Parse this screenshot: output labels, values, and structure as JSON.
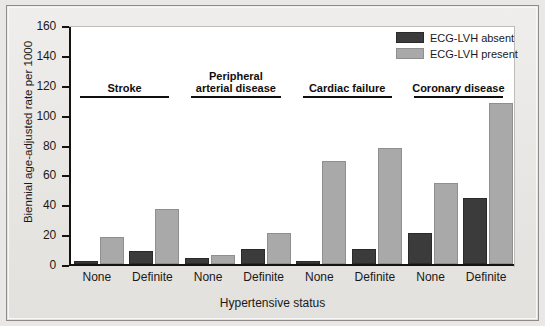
{
  "chart_data": {
    "type": "bar",
    "title": "",
    "xlabel": "Hypertensive status",
    "ylabel": "Biennial age-adjusted rate per 1000",
    "ylim": [
      0,
      160
    ],
    "yticks": [
      0,
      20,
      40,
      60,
      80,
      100,
      120,
      140,
      160
    ],
    "grid": false,
    "legend_position": "top-right",
    "categories": [
      "None",
      "Definite",
      "None",
      "Definite",
      "None",
      "Definite",
      "None",
      "Definite"
    ],
    "group_labels": [
      "Stroke",
      "Peripheral arterial disease",
      "Cardiac failure",
      "Coronary disease"
    ],
    "series": [
      {
        "name": "ECG-LVH absent",
        "color": "#3b3b3b",
        "values": [
          2,
          9,
          4,
          10,
          2,
          10,
          21,
          44
        ]
      },
      {
        "name": "ECG-LVH present",
        "color": "#a9a9a9",
        "values": [
          18,
          37,
          6,
          21,
          69,
          78,
          54,
          108
        ]
      }
    ]
  },
  "axis": {
    "y_tick_labels": [
      "0",
      "20",
      "40",
      "60",
      "80",
      "100",
      "120",
      "140",
      "160"
    ],
    "y_title": "Biennial age-adjusted rate per 1000",
    "x_title": "Hypertensive status",
    "x_tick_labels": [
      "None",
      "Definite",
      "None",
      "Definite",
      "None",
      "Definite",
      "None",
      "Definite"
    ]
  },
  "groups": [
    {
      "label_line1": "Stroke",
      "label_line2": ""
    },
    {
      "label_line1": "Peripheral",
      "label_line2": "arterial disease"
    },
    {
      "label_line1": "Cardiac failure",
      "label_line2": ""
    },
    {
      "label_line1": "Coronary disease",
      "label_line2": ""
    }
  ],
  "legend": {
    "items": [
      {
        "label": "ECG-LVH absent",
        "color": "#3b3b3b"
      },
      {
        "label": "ECG-LVH present",
        "color": "#a9a9a9"
      }
    ]
  },
  "colors": {
    "dark_bar": "#3b3b3b",
    "light_bar": "#a9a9a9",
    "plot_background": "#ffffff",
    "figure_background": "#e9e8e6",
    "axis": "#15120f"
  }
}
